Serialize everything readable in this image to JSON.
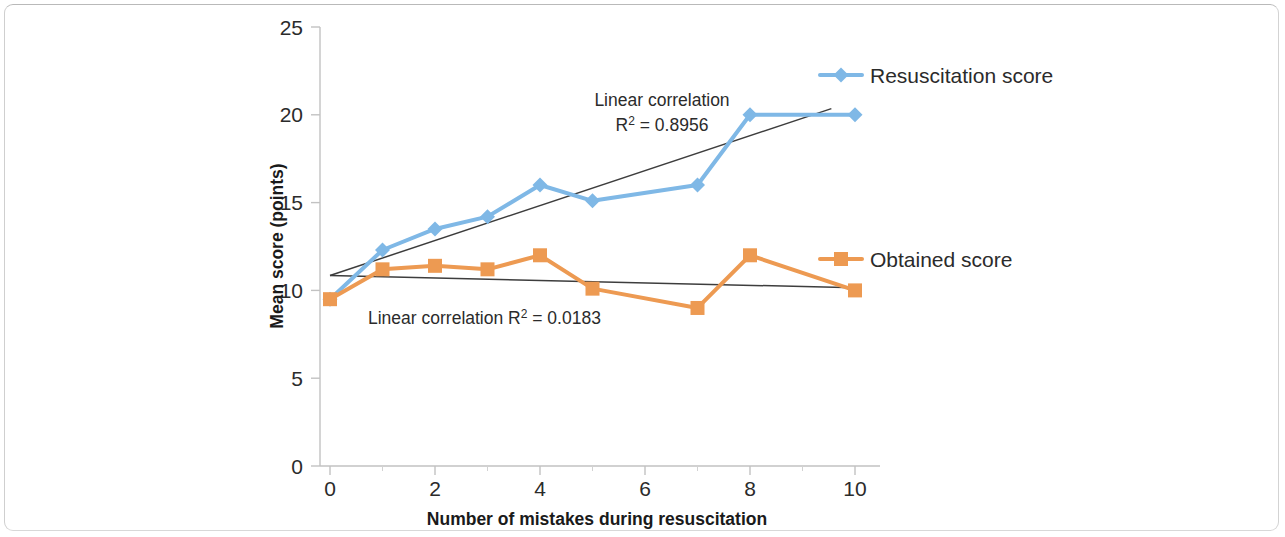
{
  "chart_data": {
    "type": "line",
    "title": "",
    "xlabel": "Number of mistakes during resuscitation",
    "ylabel": "Mean score (points)",
    "x": [
      0,
      1,
      2,
      3,
      4,
      5,
      7,
      8,
      10
    ],
    "xlim": [
      0,
      10
    ],
    "ylim": [
      0,
      25
    ],
    "xticks": [
      0,
      2,
      4,
      6,
      8,
      10
    ],
    "xtick_labels": [
      "0",
      "2",
      "4",
      "6",
      "8",
      "10"
    ],
    "xminor_ticks": [
      1,
      3,
      5,
      7,
      9
    ],
    "yticks": [
      0,
      5,
      10,
      15,
      20,
      25
    ],
    "ytick_labels": [
      "0",
      "5",
      "10",
      "15",
      "20",
      "25"
    ],
    "grid": false,
    "legend_position": "inside-right",
    "series": [
      {
        "name": "Resuscitation score",
        "color": "#7FB8E6",
        "marker": "diamond",
        "values": [
          9.5,
          12.3,
          13.5,
          14.2,
          16.0,
          15.1,
          16.0,
          20.0,
          20.0
        ]
      },
      {
        "name": "Obtained score",
        "color": "#ED9A52",
        "marker": "square",
        "values": [
          9.5,
          11.2,
          11.4,
          11.2,
          12.0,
          10.1,
          9.0,
          12.0,
          10.0
        ]
      }
    ],
    "trendlines": [
      {
        "for_series": "Resuscitation score",
        "color": "#3d3d3d",
        "x_start": 0.0,
        "y_start": 10.85,
        "x_end": 9.55,
        "y_end": 20.35,
        "r_squared": 0.8956
      },
      {
        "for_series": "Obtained score",
        "color": "#3d3d3d",
        "x_start": 0.0,
        "y_start": 10.85,
        "x_end": 10.0,
        "y_end": 10.15,
        "r_squared": 0.0183
      }
    ],
    "annotations": [
      {
        "id": "blue-trend-annotation",
        "line1": "Linear correlation",
        "line2_prefix": "R",
        "line2_sup": "2",
        "line2_suffix": " = 0.8956",
        "x": 662,
        "y": 106
      },
      {
        "id": "orange-trend-annotation",
        "line1": "Linear correlation  ",
        "line2_prefix": "R",
        "line2_sup": "2",
        "line2_suffix": " = 0.0183",
        "x": 368,
        "y": 324
      }
    ]
  },
  "legend": {
    "items": [
      {
        "label": "Resuscitation score",
        "color": "#7FB8E6",
        "marker": "diamond",
        "x": 820,
        "y": 75
      },
      {
        "label": "Obtained score",
        "color": "#ED9A52",
        "marker": "square",
        "x": 820,
        "y": 259
      }
    ]
  },
  "axes": {
    "x_title": "Number of mistakes during resuscitation",
    "y_title": "Mean score (points)",
    "axis_color": "#bfbfbf"
  },
  "colors": {
    "series_blue": "#7FB8E6",
    "series_orange": "#ED9A52",
    "trendline": "#3d3d3d",
    "text": "#2b2b2b",
    "frame": "#b9b9b9"
  }
}
